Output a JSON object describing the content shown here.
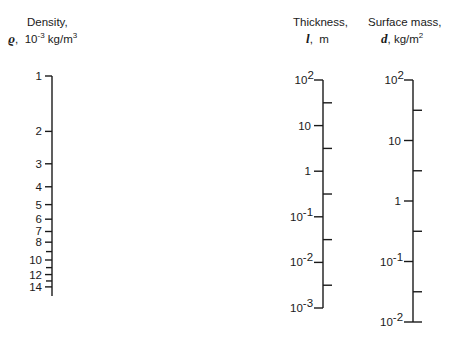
{
  "scales": {
    "density": {
      "title": "Density,",
      "symbol": "ϱ",
      "sep": ",",
      "unit_prefix": "10",
      "unit_exp": "-3",
      "unit_suffix": " kg/m",
      "unit_suffix_exp": "3"
    },
    "thickness": {
      "title": "Thickness,",
      "symbol": "l",
      "sep": ",",
      "unit": "m"
    },
    "surface_mass": {
      "title": "Surface mass,",
      "symbol": "d",
      "sep": ",",
      "unit": "kg/m",
      "unit_exp": "2"
    }
  },
  "chart_data": {
    "type": "nomogram",
    "title": "",
    "axes": [
      {
        "name": "Density",
        "symbol": "ρ",
        "unit": "10^-3 kg/m^3",
        "scale": "log",
        "range": [
          1,
          15
        ],
        "x": 52,
        "y_top": 76,
        "y_bottom": 296,
        "px_per_decade": 184,
        "labeled_ticks": [
          {
            "label": "1",
            "value": 1
          },
          {
            "label": "2",
            "value": 2
          },
          {
            "label": "3",
            "value": 3
          },
          {
            "label": "4",
            "value": 4
          },
          {
            "label": "5",
            "value": 5
          },
          {
            "label": "6",
            "value": 6
          },
          {
            "label": "7",
            "value": 7
          },
          {
            "label": "8",
            "value": 8
          },
          {
            "label": "10",
            "value": 10
          },
          {
            "label": "12",
            "value": 12
          },
          {
            "label": "14",
            "value": 14
          }
        ],
        "minor_ticks": [
          9,
          11,
          13
        ],
        "tick_side": "left"
      },
      {
        "name": "Thickness",
        "symbol": "l",
        "unit": "m",
        "scale": "log",
        "range": [
          0.001,
          100
        ],
        "x": 323,
        "y_top": 80,
        "px_per_decade": 45.6,
        "labeled_ticks": [
          {
            "base": "10",
            "exp": "2",
            "value": 100
          },
          {
            "base": "10",
            "exp": "",
            "value": 10
          },
          {
            "base": "1",
            "exp": "",
            "value": 1
          },
          {
            "base": "10",
            "exp": "-1",
            "value": 0.1
          },
          {
            "base": "10",
            "exp": "-2",
            "value": 0.01
          },
          {
            "base": "10",
            "exp": "-3",
            "value": 0.001
          }
        ],
        "minor_ticks": [
          31.6,
          3.16,
          0.316,
          0.0316,
          0.00316
        ],
        "tick_side": "left",
        "minor_side": "right"
      },
      {
        "name": "Surface mass",
        "symbol": "d",
        "unit": "kg/m^2",
        "scale": "log",
        "range": [
          0.01,
          100
        ],
        "x": 413,
        "y_top": 80,
        "px_per_decade": 60.5,
        "labeled_ticks": [
          {
            "base": "10",
            "exp": "2",
            "value": 100
          },
          {
            "base": "10",
            "exp": "",
            "value": 10
          },
          {
            "base": "1",
            "exp": "",
            "value": 1
          },
          {
            "base": "10",
            "exp": "-1",
            "value": 0.1
          },
          {
            "base": "10",
            "exp": "-2",
            "value": 0.01
          }
        ],
        "minor_ticks": [
          31.6,
          3.16,
          0.316,
          0.0316
        ],
        "tick_side": "left",
        "minor_side": "right"
      }
    ],
    "relation": "d = rho * l (kg/m^2)",
    "colors": {
      "line": "#1a1a1a",
      "background": "#ffffff"
    }
  }
}
